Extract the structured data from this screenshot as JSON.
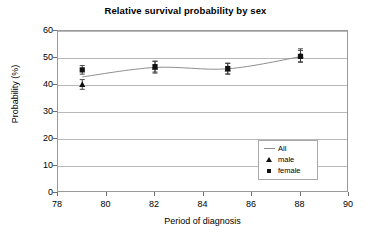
{
  "chart_data": {
    "type": "line",
    "title": "Relative survival probability by sex",
    "xlabel": "Period of diagnosis",
    "ylabel": "Probability (%)",
    "xlim": [
      78,
      90
    ],
    "ylim": [
      0,
      60
    ],
    "xticks": [
      78,
      80,
      82,
      84,
      86,
      88,
      90
    ],
    "yticks": [
      0,
      10,
      20,
      30,
      40,
      50,
      60
    ],
    "grid": "horizontal",
    "legend_position": "inside-right",
    "x": [
      79,
      82,
      85,
      88
    ],
    "series": [
      {
        "name": "All",
        "marker": "line",
        "values": [
          43.0,
          46.5,
          46.0,
          50.5
        ],
        "errors": [
          null,
          null,
          null,
          null
        ]
      },
      {
        "name": "male",
        "marker": "triangle",
        "values": [
          40.2,
          46.6,
          46.0,
          51.0
        ],
        "errors": [
          1.8,
          2.2,
          2.0,
          2.4
        ]
      },
      {
        "name": "female",
        "marker": "square",
        "values": [
          45.6,
          46.8,
          46.1,
          50.6
        ],
        "errors": [
          1.6,
          2.0,
          2.0,
          2.2
        ]
      }
    ]
  },
  "legend": {
    "items": [
      {
        "label": "All",
        "key": "line-key"
      },
      {
        "label": "male",
        "key": "triangle-key"
      },
      {
        "label": "female",
        "key": "square-key"
      }
    ]
  }
}
